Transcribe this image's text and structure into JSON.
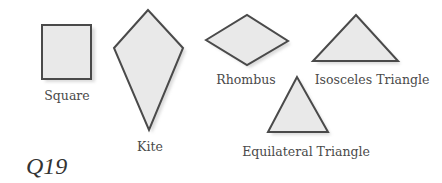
{
  "figure": {
    "question_label": "Q19",
    "colors": {
      "fill": "#e9e9e9",
      "stroke": "#4a4a4a",
      "text": "#4a4a4a",
      "background": "#ffffff"
    },
    "shapes": [
      {
        "name": "square",
        "label": "Square"
      },
      {
        "name": "kite",
        "label": "Kite"
      },
      {
        "name": "rhombus",
        "label": "Rhombus"
      },
      {
        "name": "isosceles-triangle",
        "label": "Isosceles Triangle"
      },
      {
        "name": "equilateral-triangle",
        "label": "Equilateral Triangle"
      }
    ]
  }
}
